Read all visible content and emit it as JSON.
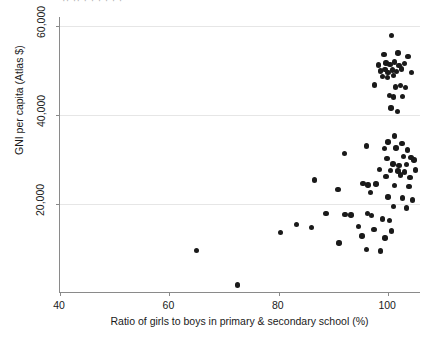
{
  "figure": {
    "background": "#ffffff",
    "point_color": "#1a1a1a",
    "axis_color": "#8a8a8a",
    "grid_color": "#e6e6e6",
    "title_fragment": "·· ··  ·  ·       ·       ·            ·        ·"
  },
  "chart_data": {
    "type": "scatter",
    "title": "",
    "xlabel": "Ratio of girls to boys in primary & secondary school (%)",
    "ylabel": "GNI per capita (Atlas $)",
    "xlim": [
      40,
      106
    ],
    "ylim": [
      0,
      62000
    ],
    "xticks": [
      40,
      60,
      80,
      100
    ],
    "xticklabels": [
      "40",
      "60",
      "80",
      "100"
    ],
    "yticks": [
      20000,
      40000,
      60000,
      80000
    ],
    "yticklabels": [
      "20,000",
      "40,000",
      "60,000",
      "80,000"
    ],
    "grid": true,
    "legend": null,
    "points": [
      {
        "x": 100.6,
        "y": 57800
      },
      {
        "x": 99.2,
        "y": 53600
      },
      {
        "x": 101.8,
        "y": 53900
      },
      {
        "x": 103.6,
        "y": 53100
      },
      {
        "x": 98.2,
        "y": 51200
      },
      {
        "x": 99.6,
        "y": 51700
      },
      {
        "x": 100.3,
        "y": 51300
      },
      {
        "x": 101.1,
        "y": 51900
      },
      {
        "x": 102.0,
        "y": 51100
      },
      {
        "x": 103.0,
        "y": 51600
      },
      {
        "x": 98.6,
        "y": 49900
      },
      {
        "x": 99.4,
        "y": 50200
      },
      {
        "x": 100.0,
        "y": 49600
      },
      {
        "x": 100.8,
        "y": 50100
      },
      {
        "x": 101.5,
        "y": 49800
      },
      {
        "x": 102.4,
        "y": 50300
      },
      {
        "x": 99.0,
        "y": 48700
      },
      {
        "x": 99.9,
        "y": 48400
      },
      {
        "x": 101.0,
        "y": 48900
      },
      {
        "x": 104.3,
        "y": 49500
      },
      {
        "x": 97.5,
        "y": 46700
      },
      {
        "x": 101.3,
        "y": 46300
      },
      {
        "x": 102.2,
        "y": 46600
      },
      {
        "x": 103.2,
        "y": 46100
      },
      {
        "x": 100.2,
        "y": 44400
      },
      {
        "x": 101.0,
        "y": 44000
      },
      {
        "x": 102.6,
        "y": 44200
      },
      {
        "x": 100.5,
        "y": 41600
      },
      {
        "x": 101.7,
        "y": 40800
      },
      {
        "x": 101.2,
        "y": 35300
      },
      {
        "x": 100.0,
        "y": 33900
      },
      {
        "x": 102.5,
        "y": 33600
      },
      {
        "x": 96.0,
        "y": 33000
      },
      {
        "x": 99.3,
        "y": 32400
      },
      {
        "x": 101.4,
        "y": 32600
      },
      {
        "x": 103.5,
        "y": 32100
      },
      {
        "x": 92.0,
        "y": 31400
      },
      {
        "x": 99.8,
        "y": 30200
      },
      {
        "x": 102.8,
        "y": 30600
      },
      {
        "x": 104.2,
        "y": 30400
      },
      {
        "x": 104.7,
        "y": 29900
      },
      {
        "x": 100.9,
        "y": 29000
      },
      {
        "x": 102.0,
        "y": 28600
      },
      {
        "x": 103.3,
        "y": 28800
      },
      {
        "x": 98.4,
        "y": 27800
      },
      {
        "x": 100.4,
        "y": 27500
      },
      {
        "x": 101.8,
        "y": 27400
      },
      {
        "x": 103.0,
        "y": 27200
      },
      {
        "x": 105.0,
        "y": 27600
      },
      {
        "x": 99.6,
        "y": 26200
      },
      {
        "x": 102.3,
        "y": 26500
      },
      {
        "x": 104.0,
        "y": 26000
      },
      {
        "x": 86.5,
        "y": 25400
      },
      {
        "x": 95.4,
        "y": 24600
      },
      {
        "x": 96.3,
        "y": 24300
      },
      {
        "x": 97.8,
        "y": 24500
      },
      {
        "x": 101.2,
        "y": 24100
      },
      {
        "x": 103.8,
        "y": 23900
      },
      {
        "x": 90.8,
        "y": 23200
      },
      {
        "x": 96.8,
        "y": 22600
      },
      {
        "x": 100.0,
        "y": 21600
      },
      {
        "x": 102.6,
        "y": 21300
      },
      {
        "x": 104.4,
        "y": 20900
      },
      {
        "x": 101.0,
        "y": 19400
      },
      {
        "x": 103.4,
        "y": 19100
      },
      {
        "x": 88.6,
        "y": 17800
      },
      {
        "x": 92.1,
        "y": 17600
      },
      {
        "x": 93.2,
        "y": 17500
      },
      {
        "x": 96.2,
        "y": 17800
      },
      {
        "x": 96.9,
        "y": 17400
      },
      {
        "x": 99.0,
        "y": 16600
      },
      {
        "x": 100.2,
        "y": 16300
      },
      {
        "x": 83.2,
        "y": 15400
      },
      {
        "x": 86.0,
        "y": 14700
      },
      {
        "x": 94.6,
        "y": 14900
      },
      {
        "x": 97.4,
        "y": 14200
      },
      {
        "x": 100.6,
        "y": 13900
      },
      {
        "x": 80.3,
        "y": 13600
      },
      {
        "x": 95.2,
        "y": 12800
      },
      {
        "x": 99.4,
        "y": 12400
      },
      {
        "x": 65.0,
        "y": 9600
      },
      {
        "x": 91.0,
        "y": 11200
      },
      {
        "x": 96.0,
        "y": 9800
      },
      {
        "x": 98.6,
        "y": 9400
      },
      {
        "x": 72.5,
        "y": 1800
      }
    ]
  }
}
